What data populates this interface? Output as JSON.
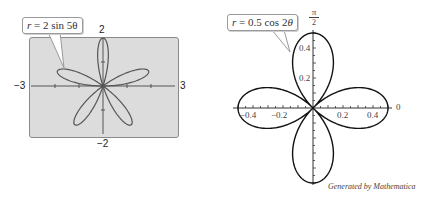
{
  "chart_data": [
    {
      "type": "line",
      "subtype": "polar-rose",
      "title": "r = 2 sin 5θ",
      "equation": "r = 2 sin 5θ",
      "petals": 5,
      "amplitude": 2,
      "xlim": [
        -3,
        3
      ],
      "ylim": [
        -2,
        2
      ],
      "tick_labels": {
        "x_min": "−3",
        "x_max": "3",
        "y_max": "2",
        "y_min": "−2"
      },
      "grid": false,
      "background": "#d9d9d9",
      "style": "graphing-calculator window"
    },
    {
      "type": "line",
      "subtype": "polar-rose",
      "title": "r = 0.5 cos 2θ",
      "equation": "r = 0.5 cos 2θ",
      "petals": 4,
      "amplitude": 0.5,
      "xlim": [
        -0.5,
        0.5
      ],
      "ylim": [
        -0.5,
        0.5
      ],
      "x_ticks": [
        "−0.4",
        "−0.2",
        "0.2",
        "0.4"
      ],
      "y_ticks": [
        "0.2",
        "0.4"
      ],
      "angle_labels": {
        "zero": "0",
        "half_pi": "π/2"
      },
      "grid": false,
      "annotation": "Generated by Mathematica"
    }
  ],
  "left": {
    "callout": {
      "prefix": "r",
      "eq": " = 2 sin 5",
      "theta": "θ"
    },
    "labels": {
      "y_top": "2",
      "y_bottom": "−2",
      "x_left": "−3",
      "x_right": "3"
    }
  },
  "right": {
    "callout": {
      "prefix": "r",
      "eq": " = 0.5 cos 2",
      "theta": "θ"
    },
    "labels": {
      "pi_num": "π",
      "pi_den": "2",
      "zero": "0",
      "y_04": "0.4",
      "y_02": "0.2",
      "x_m04": "−0.4",
      "x_m02": "−0.2",
      "x_02": "0.2",
      "x_04": "0.4"
    },
    "credit": "Generated by Mathematica"
  }
}
